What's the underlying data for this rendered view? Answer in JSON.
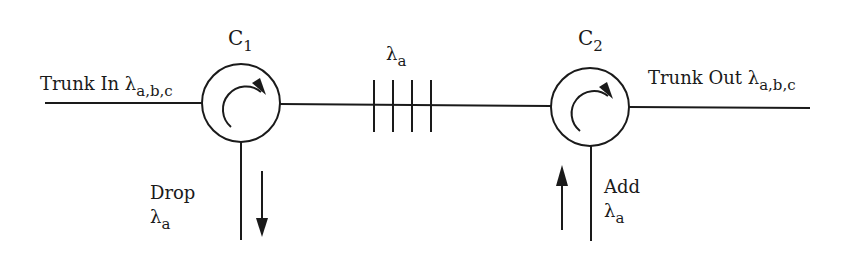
{
  "diagram": {
    "type": "optical-add-drop-multiplexer",
    "circulators": [
      {
        "id": "c1",
        "label": "C",
        "subscript": "1"
      },
      {
        "id": "c2",
        "label": "C",
        "subscript": "2"
      }
    ],
    "grating": {
      "label": "λ",
      "subscript": "a",
      "tick_count": 4
    },
    "trunk_in": {
      "label": "Trunk In λ",
      "subscript": "a,b,c"
    },
    "trunk_out": {
      "label": "Trunk Out λ",
      "subscript": "a,b,c"
    },
    "drop": {
      "label": "Drop",
      "wavelength": "λ",
      "subscript": "a",
      "arrow_direction": "down"
    },
    "add": {
      "label": "Add",
      "wavelength": "λ",
      "subscript": "a",
      "arrow_direction": "up"
    },
    "colors": {
      "stroke": "#1a1a1a",
      "background": "#ffffff"
    }
  }
}
